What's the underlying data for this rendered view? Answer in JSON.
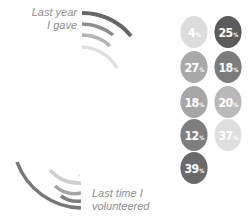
{
  "labels": {
    "top": [
      "Last year",
      "I gave"
    ],
    "bottom": [
      "Last time I",
      "volunteered"
    ]
  },
  "colors": {
    "dark": "#5b5b5b",
    "mid_dark": "#7c7c7c",
    "mid": "#9a9a9a",
    "light": "#c8c8c8",
    "very_light": "#e2e2e2"
  },
  "bubbles": [
    {
      "value": "4",
      "unit": "%",
      "color": "#dcdcdc"
    },
    {
      "value": "25",
      "unit": "%",
      "color": "#5b5b5b"
    },
    {
      "value": "27",
      "unit": "%",
      "color": "#a9a9a9"
    },
    {
      "value": "18",
      "unit": "%",
      "color": "#7c7c7c"
    },
    {
      "value": "18",
      "unit": "%",
      "color": "#a6a6a6"
    },
    {
      "value": "20",
      "unit": "%",
      "color": "#b9b9b9"
    },
    {
      "value": "12",
      "unit": "%",
      "color": "#7e7e7e"
    },
    {
      "value": "37",
      "unit": "%",
      "color": "#dedede"
    },
    {
      "value": "39",
      "unit": "%",
      "color": "#6a6a6a"
    }
  ]
}
